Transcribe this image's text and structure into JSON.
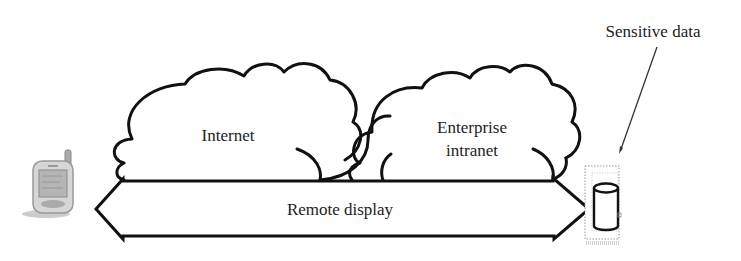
{
  "diagram": {
    "clouds": [
      {
        "id": "internet",
        "label": "Internet"
      },
      {
        "id": "enterprise-intranet",
        "label_line1": "Enterprise",
        "label_line2": "intranet"
      }
    ],
    "arrow": {
      "label": "Remote display",
      "direction": "bidirectional"
    },
    "left_device": {
      "icon": "pda-phone-icon"
    },
    "right_device": {
      "icon": "database-server-icon"
    },
    "annotation": {
      "label": "Sensitive data",
      "points_to": "database-server"
    },
    "colors": {
      "stroke": "#111111",
      "background": "#ffffff",
      "device_gray": "#9a9a9a"
    }
  }
}
